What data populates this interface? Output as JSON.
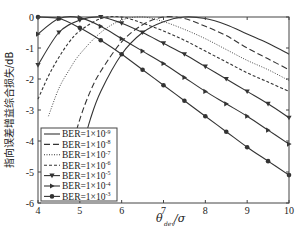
{
  "chart_data": {
    "type": "line",
    "title": "",
    "xlabel": "θ_dev/σ",
    "xlabel_main": "θ",
    "xlabel_sub": "dev",
    "xlabel_tail": "/σ",
    "ylabel": "指向误差增益综合损失/dB",
    "xlim": [
      4,
      10
    ],
    "ylim": [
      -6,
      0
    ],
    "xticks": [
      4,
      5,
      6,
      7,
      8,
      9,
      10
    ],
    "yticks": [
      0,
      -1,
      -2,
      -3,
      -4,
      -5,
      -6
    ],
    "grid": false,
    "legend_position": "lower-left",
    "x": [
      4,
      4.5,
      5,
      5.5,
      6,
      6.5,
      7,
      7.5,
      8,
      8.5,
      9,
      9.5,
      10
    ],
    "series": [
      {
        "name": "BER=1×10⁻⁹",
        "style": "solid",
        "marker": "none",
        "x": [
          5.0,
          5.25,
          5.5,
          6,
          6.5,
          7,
          7.5,
          8,
          8.5,
          9,
          9.5,
          10
        ],
        "values": [
          -4.5,
          -3.3,
          -2.4,
          -1.2,
          -0.5,
          -0.15,
          0,
          -0.05,
          -0.25,
          -0.55,
          -0.85,
          -1.2
        ]
      },
      {
        "name": "BER=1×10⁻⁸",
        "style": "longdash",
        "marker": "none",
        "x": [
          4.75,
          5.0,
          5.25,
          5.5,
          6,
          6.5,
          7,
          7.5,
          8,
          8.5,
          9,
          9.5,
          10
        ],
        "values": [
          -4.5,
          -3.3,
          -2.4,
          -1.75,
          -0.8,
          -0.25,
          0,
          -0.05,
          -0.3,
          -0.6,
          -1.0,
          -1.35,
          -1.7
        ]
      },
      {
        "name": "BER=1×10⁻⁷",
        "style": "dotted",
        "marker": "none",
        "x": [
          4.25,
          4.5,
          4.75,
          5,
          5.5,
          6,
          6.5,
          7,
          7.5,
          8,
          8.5,
          9,
          9.5,
          10
        ],
        "values": [
          -3.2,
          -2.3,
          -1.7,
          -1.2,
          -0.5,
          -0.1,
          0,
          -0.15,
          -0.4,
          -0.7,
          -1.05,
          -1.4,
          -1.7,
          -2.05
        ]
      },
      {
        "name": "BER=1×10⁻⁶",
        "style": "dashed",
        "marker": "none",
        "x": [
          4,
          4.25,
          4.5,
          4.75,
          5,
          5.5,
          6,
          6.5,
          7,
          7.5,
          8,
          8.5,
          9,
          9.5,
          10
        ],
        "values": [
          -2.65,
          -1.9,
          -1.3,
          -0.8,
          -0.45,
          -0.05,
          0,
          -0.2,
          -0.45,
          -0.75,
          -1.1,
          -1.45,
          -1.8,
          -2.1,
          -2.4
        ]
      },
      {
        "name": "BER=1×10⁻⁵",
        "style": "solid",
        "marker": "triangle-down",
        "x": [
          4,
          4.5,
          5,
          5.5,
          6,
          6.5,
          7,
          7.5,
          8,
          8.5,
          9,
          9.5,
          10
        ],
        "values": [
          -1.55,
          -0.5,
          -0.1,
          0,
          -0.2,
          -0.5,
          -0.85,
          -1.2,
          -1.6,
          -2.0,
          -2.4,
          -2.8,
          -3.25
        ]
      },
      {
        "name": "BER=1×10⁻⁴",
        "style": "solid",
        "marker": "triangle-right",
        "x": [
          4,
          4.5,
          5,
          5.5,
          6,
          6.5,
          7,
          7.5,
          8,
          8.5,
          9,
          9.5,
          10
        ],
        "values": [
          -0.55,
          -0.05,
          -0.02,
          -0.3,
          -0.7,
          -1.1,
          -1.5,
          -1.95,
          -2.4,
          -2.8,
          -3.2,
          -3.65,
          -4.1
        ]
      },
      {
        "name": "BER=1×10⁻³",
        "style": "solid",
        "marker": "circle",
        "x": [
          4,
          4.5,
          5,
          5.5,
          6,
          6.5,
          7,
          7.5,
          8,
          8.5,
          9,
          9.5,
          10
        ],
        "values": [
          0,
          -0.05,
          -0.35,
          -0.75,
          -1.2,
          -1.7,
          -2.2,
          -2.7,
          -3.2,
          -3.7,
          -4.2,
          -4.65,
          -5.1
        ]
      }
    ]
  },
  "legend": {
    "items": [
      {
        "label": "BER=1×10",
        "exp": "-9"
      },
      {
        "label": "BER=1×10",
        "exp": "-8"
      },
      {
        "label": "BER=1×10",
        "exp": "-7"
      },
      {
        "label": "BER=1×10",
        "exp": "-6"
      },
      {
        "label": "BER=1×10",
        "exp": "-5"
      },
      {
        "label": "BER=1×10",
        "exp": "-4"
      },
      {
        "label": "BER=1×10",
        "exp": "-3"
      }
    ]
  },
  "colors": {
    "line": "#333333",
    "axis": "#444444",
    "background": "#ffffff"
  }
}
